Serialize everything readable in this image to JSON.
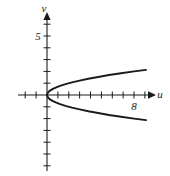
{
  "figure": {
    "background_color": "#ffffff",
    "ink_color": "#1a1a1a"
  },
  "chart_data": {
    "type": "line",
    "title": "",
    "subtitle": "",
    "xlabel": "u",
    "ylabel": "v",
    "xlim": [
      -2.7,
      10.2
    ],
    "ylim": [
      -6.4,
      6.5
    ],
    "grid": false,
    "legend": null,
    "annotations": [],
    "x_tick_labels": [
      {
        "value": 8,
        "label": "8"
      }
    ],
    "y_tick_labels": [
      {
        "value": 5,
        "label": "5"
      }
    ],
    "x_ticks": [
      -2,
      -1,
      1,
      2,
      3,
      4,
      5,
      6,
      7,
      8,
      9
    ],
    "y_ticks": [
      -6,
      -5,
      -4,
      -3,
      -2,
      -1,
      1,
      2,
      3,
      4,
      5,
      6
    ],
    "axis_arrows": {
      "x_positive": true,
      "y_positive": true
    },
    "series": [
      {
        "name": "v = sqrt(u/2) upper branch",
        "x": [
          0,
          0.1,
          0.25,
          0.5,
          0.8,
          1.2,
          1.7,
          2.3,
          3.0,
          3.8,
          4.7,
          5.7,
          6.8,
          8.0,
          9.1
        ],
        "values": [
          0,
          0.22,
          0.35,
          0.5,
          0.63,
          0.77,
          0.92,
          1.07,
          1.22,
          1.38,
          1.53,
          1.69,
          1.84,
          2.0,
          2.13
        ]
      },
      {
        "name": "v = -sqrt(u/2) lower branch",
        "x": [
          0,
          0.1,
          0.25,
          0.5,
          0.8,
          1.2,
          1.7,
          2.3,
          3.0,
          3.8,
          4.7,
          5.7,
          6.8,
          8.0,
          9.1
        ],
        "values": [
          0,
          -0.22,
          -0.35,
          -0.5,
          -0.63,
          -0.77,
          -0.92,
          -1.07,
          -1.22,
          -1.38,
          -1.53,
          -1.69,
          -1.84,
          -2.0,
          -2.13
        ]
      }
    ]
  },
  "labels": {
    "v_axis": "v",
    "u_axis": "u",
    "y_tick_5": "5",
    "x_tick_8": "8"
  }
}
